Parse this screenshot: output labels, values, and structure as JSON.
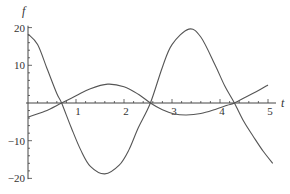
{
  "chart_data": {
    "type": "line",
    "title": "",
    "xlabel": "t",
    "ylabel": "f",
    "xlim": [
      0,
      5.1
    ],
    "ylim": [
      -20,
      20
    ],
    "grid": false,
    "legend": null,
    "x_ticks": [
      1,
      2,
      3,
      4,
      5
    ],
    "y_ticks": [
      -20,
      -10,
      10,
      20
    ],
    "series": [
      {
        "name": "small-amplitude curve",
        "x": [
          0,
          0.35,
          0.7,
          1.0,
          1.3,
          1.66,
          2.0,
          2.3,
          2.55,
          2.8,
          3.05,
          3.3,
          3.6,
          3.9,
          4.15,
          4.3,
          4.6,
          4.8,
          5.0
        ],
        "y": [
          -3.7,
          -2.2,
          0,
          1.9,
          3.8,
          5.0,
          4.3,
          2.3,
          0,
          -1.8,
          -2.9,
          -3.2,
          -2.8,
          -1.7,
          -0.6,
          0,
          2.0,
          3.3,
          4.8
        ]
      },
      {
        "name": "large-amplitude curve",
        "x": [
          0,
          0.2,
          0.4,
          0.6,
          0.7,
          0.9,
          1.1,
          1.3,
          1.6,
          1.9,
          2.1,
          2.3,
          2.55,
          2.8,
          3.0,
          3.35,
          3.6,
          3.9,
          4.1,
          4.3,
          4.5,
          4.7,
          4.9,
          5.1
        ],
        "y": [
          18.3,
          15.5,
          9.0,
          2.5,
          0,
          -6.5,
          -12.5,
          -16.8,
          -18.8,
          -16.5,
          -12.5,
          -6.5,
          0,
          9.5,
          15.5,
          19.6,
          17.5,
          10.0,
          4.5,
          0,
          -5.0,
          -9.0,
          -12.8,
          -16.0
        ]
      }
    ]
  },
  "labels": {
    "x_axis": "t",
    "y_axis": "f",
    "x_tick_labels": [
      "1",
      "2",
      "3",
      "4",
      "5"
    ],
    "y_tick_labels": [
      "20",
      "10",
      "−10",
      "−20"
    ]
  }
}
